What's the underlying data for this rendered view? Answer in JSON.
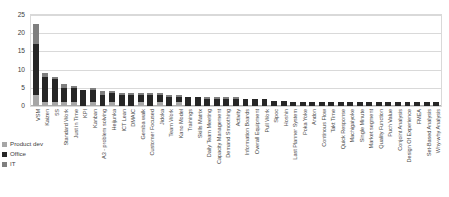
{
  "chart_data": {
    "type": "bar",
    "subtype": "stacked-column",
    "title": "",
    "xlabel": "",
    "ylabel": "",
    "ylim": [
      0,
      25
    ],
    "yticks": [
      0,
      5,
      10,
      15,
      20,
      25
    ],
    "grid": true,
    "legend_position": "bottom-left",
    "colors": {
      "product_dev": "#a6a6a6",
      "office": "#262626",
      "it": "#7f7f7f"
    },
    "categories": [
      "VSM",
      "Kaizen",
      "5S",
      "Standard Work",
      "Just in Time",
      "KPI",
      "Kanban",
      "A3 - problem solving",
      "Heijunka",
      "ICT Lean",
      "DMAIC",
      "Gemba walk",
      "Customer Focused",
      "Jidoka",
      "Team Work",
      "Kano Model",
      "Trainings",
      "Skills Matrix",
      "Daily Team Meeting",
      "Capacity Management",
      "Demand Smoothing",
      "Activity",
      "Information Boards",
      "Overall Equipment",
      "Pull Work",
      "Sipoc",
      "Hoshin",
      "Last Planner System",
      "Poka Yoke",
      "Andon",
      "Continous Flow",
      "Takt Time",
      "Quick Response",
      "Machigaiyoke",
      "Single Minute",
      "Market segment",
      "Quality Function",
      "Puch Value",
      "Conjoint Analysis",
      "Design Of Experience",
      "FMEA",
      "Set-Based Analysis",
      "Why-why Analysis"
    ],
    "series": [
      {
        "name": "Product dev",
        "color": "#a6a6a6",
        "values": [
          3,
          1,
          1,
          1,
          1,
          0,
          1,
          0,
          1,
          0,
          0,
          1,
          0,
          1,
          0,
          1,
          0,
          0,
          0,
          0,
          0,
          0,
          0,
          0,
          0,
          0,
          0,
          0,
          0,
          0,
          0,
          0,
          0,
          0,
          0,
          0,
          0,
          0,
          0,
          0,
          0,
          0,
          0
        ]
      },
      {
        "name": "Office",
        "color": "#262626",
        "values": [
          14,
          7,
          6.5,
          4,
          4,
          4.5,
          3.5,
          3,
          2.5,
          3,
          3,
          2,
          3,
          2,
          2.5,
          1.5,
          2.5,
          2.5,
          2,
          2,
          2,
          2,
          2,
          2,
          2,
          1.5,
          1.5,
          1,
          1,
          1,
          1,
          1,
          1,
          1,
          1,
          1,
          1,
          1,
          1,
          1,
          1,
          1,
          1
        ]
      },
      {
        "name": "IT",
        "color": "#7f7f7f",
        "values": [
          5.5,
          1,
          0.5,
          1,
          0.5,
          0,
          0.5,
          1,
          0.5,
          0.5,
          0.5,
          0.5,
          0.5,
          0.5,
          0.5,
          0.5,
          0,
          0,
          0.5,
          0.5,
          0.5,
          0.5,
          0,
          0,
          0,
          0,
          0,
          0,
          0,
          0,
          0,
          0,
          0,
          0,
          0,
          0,
          0,
          0,
          0,
          0,
          0,
          0,
          0
        ]
      }
    ]
  },
  "legend": {
    "items": [
      {
        "label": "Product dev",
        "color": "#a6a6a6"
      },
      {
        "label": "Office",
        "color": "#262626"
      },
      {
        "label": "IT",
        "color": "#7f7f7f"
      }
    ]
  }
}
